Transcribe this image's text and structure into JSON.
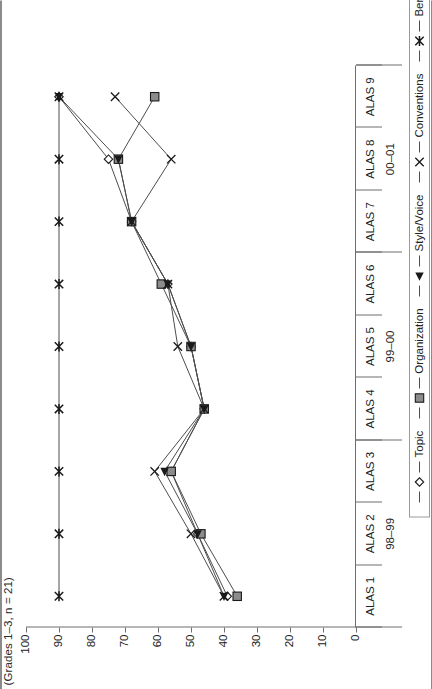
{
  "title": "(Grades 1–3, n = 21)",
  "chart_data": {
    "type": "line",
    "title": "(Grades 1–3, n = 21)",
    "xlabel": "",
    "ylabel": "",
    "ylim": [
      0,
      100
    ],
    "grid": false,
    "legend_position": "bottom",
    "orientation": "rotated-90-ccw",
    "categories": [
      "ALAS 1",
      "ALAS 2",
      "ALAS 3",
      "ALAS 4",
      "ALAS 5",
      "ALAS 6",
      "ALAS 7",
      "ALAS 8",
      "ALAS 9"
    ],
    "category_groups": [
      {
        "label": "98–99",
        "categories": [
          "ALAS 1",
          "ALAS 2",
          "ALAS 3"
        ]
      },
      {
        "label": "99–00",
        "categories": [
          "ALAS 4",
          "ALAS 5",
          "ALAS 6"
        ]
      },
      {
        "label": "00–01",
        "categories": [
          "ALAS 7",
          "ALAS 8",
          "ALAS 9"
        ]
      }
    ],
    "yticks": [
      0,
      10,
      20,
      30,
      40,
      50,
      60,
      70,
      80,
      90,
      100
    ],
    "ytick_labels": [
      "0",
      "10",
      "20",
      "30",
      "40",
      "50",
      "60",
      "70",
      "80",
      "90",
      "100"
    ],
    "series": [
      {
        "name": "Topic",
        "marker": "diamond",
        "values": [
          39,
          48,
          56,
          46,
          50,
          57,
          68,
          75,
          90
        ]
      },
      {
        "name": "Organization",
        "marker": "square",
        "values": [
          36,
          47,
          56,
          46,
          50,
          59,
          68,
          72,
          61
        ]
      },
      {
        "name": "Style/Voice",
        "marker": "triangle",
        "values": [
          40,
          48,
          58,
          46,
          50,
          57,
          68,
          72,
          90
        ]
      },
      {
        "name": "Conventions",
        "marker": "cross",
        "values": [
          40,
          50,
          61,
          46,
          54,
          57,
          68,
          56,
          73
        ]
      },
      {
        "name": "Benchmark",
        "marker": "asterisk",
        "values": [
          90,
          90,
          90,
          90,
          90,
          90,
          90,
          90,
          90
        ]
      }
    ]
  },
  "legend": {
    "items": [
      {
        "label": "Topic",
        "marker": "diamond-marker"
      },
      {
        "label": "Organization",
        "marker": "square-marker"
      },
      {
        "label": "Style/Voice",
        "marker": "triangle-marker"
      },
      {
        "label": "Conventions",
        "marker": "cross-marker"
      },
      {
        "label": "Benchmark",
        "marker": "asterisk-marker"
      }
    ]
  },
  "colors": {
    "line": "#4d4d4d",
    "axis": "#6e6e6e",
    "text": "#222222",
    "marker_fill": "#8c8c8c",
    "marker_dark": "#1a1a1a"
  }
}
